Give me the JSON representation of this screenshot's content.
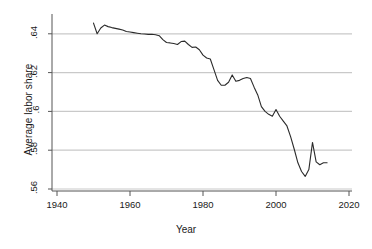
{
  "chart_data": {
    "type": "line",
    "title": "",
    "subtitle": "",
    "xlabel": "Year",
    "ylabel": "Average labor share",
    "xlim": [
      1936,
      2022
    ],
    "ylim": [
      0.5565,
      0.6495
    ],
    "xticks": [
      1940,
      1960,
      1980,
      2000,
      2020
    ],
    "xtick_labels": [
      "1940",
      "1960",
      "1980",
      "2000",
      "2020"
    ],
    "yticks": [
      0.56,
      0.58,
      0.6,
      0.62,
      0.64
    ],
    "ytick_labels": [
      ".56",
      ".58",
      ".6",
      ".62",
      ".64"
    ],
    "grid": "horizontal",
    "legend": "none",
    "line_color": "#2b2b2b",
    "grid_color": "#c9c9c9",
    "axis_color": "#555555",
    "background": "#ffffff",
    "series": [
      {
        "name": "Average labor share",
        "x": [
          1950,
          1951,
          1952,
          1953,
          1954,
          1955,
          1956,
          1957,
          1958,
          1959,
          1960,
          1961,
          1962,
          1963,
          1964,
          1965,
          1966,
          1967,
          1968,
          1969,
          1970,
          1971,
          1972,
          1973,
          1974,
          1975,
          1976,
          1977,
          1978,
          1979,
          1980,
          1981,
          1982,
          1983,
          1984,
          1985,
          1986,
          1987,
          1988,
          1989,
          1990,
          1991,
          1992,
          1993,
          1994,
          1995,
          1996,
          1997,
          1998,
          1999,
          2000,
          2001,
          2002,
          2003,
          2004,
          2005,
          2006,
          2007,
          2008,
          2009,
          2010,
          2011,
          2012,
          2013,
          2014
        ],
        "values": [
          0.6455,
          0.64,
          0.643,
          0.6445,
          0.6437,
          0.6432,
          0.6428,
          0.6424,
          0.642,
          0.6412,
          0.6409,
          0.6406,
          0.6403,
          0.64,
          0.6399,
          0.6397,
          0.6398,
          0.6395,
          0.639,
          0.637,
          0.6355,
          0.6353,
          0.635,
          0.6345,
          0.636,
          0.6362,
          0.6345,
          0.633,
          0.6332,
          0.6318,
          0.629,
          0.6275,
          0.627,
          0.6215,
          0.616,
          0.6135,
          0.6135,
          0.615,
          0.6188,
          0.6155,
          0.616,
          0.617,
          0.6175,
          0.617,
          0.6125,
          0.6085,
          0.6025,
          0.6,
          0.5985,
          0.5975,
          0.601,
          0.5975,
          0.595,
          0.5925,
          0.587,
          0.5805,
          0.5735,
          0.569,
          0.5665,
          0.57,
          0.584,
          0.574,
          0.5725,
          0.5735,
          0.5735
        ]
      }
    ]
  },
  "axis": {
    "ylabel": "Average labor share",
    "xlabel": "Year"
  }
}
